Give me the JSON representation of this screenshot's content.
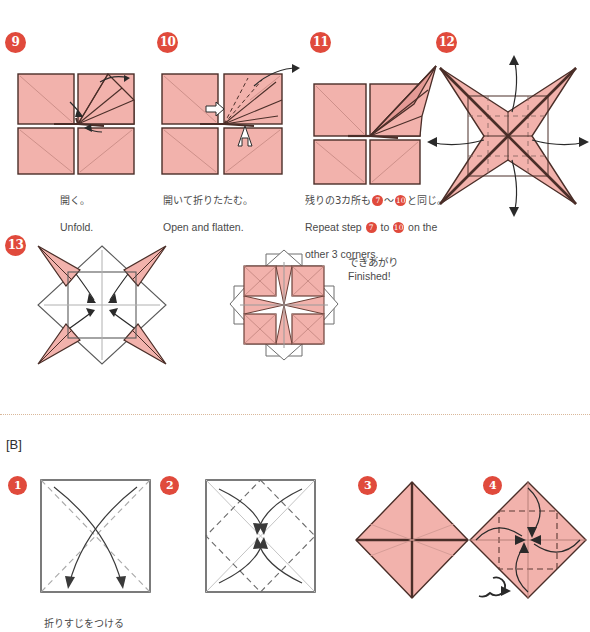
{
  "sections": [
    {
      "id": "A-continued",
      "steps": [
        {
          "number": "9",
          "caption_jp": "開く。",
          "caption_en": "Unfold."
        },
        {
          "number": "10",
          "caption_jp": "開いて折りたたむ。",
          "caption_en": "Open and flatten."
        },
        {
          "number": "11",
          "caption_jp_pre": "残りの3カ所も",
          "caption_jp_n1": "7",
          "caption_jp_mid": "～",
          "caption_jp_n2": "10",
          "caption_jp_post": "と同じ。",
          "caption_en_pre": "Repeat step ",
          "caption_en_n1": "7",
          "caption_en_mid": " to ",
          "caption_en_n2": "10",
          "caption_en_post": " on the",
          "caption_en_line2": "other 3 corners."
        },
        {
          "number": "12",
          "caption_jp": "",
          "caption_en": ""
        },
        {
          "number": "13",
          "caption_jp": "",
          "caption_en": ""
        }
      ],
      "finished_jp": "できあがり",
      "finished_en": "Finished!"
    },
    {
      "id": "B",
      "label": "[B]",
      "steps": [
        {
          "number": "1",
          "caption_jp": "折りすじをつける",
          "caption_en": ""
        },
        {
          "number": "2",
          "caption_jp": "",
          "caption_en": ""
        },
        {
          "number": "3",
          "caption_jp": "",
          "caption_en": ""
        },
        {
          "number": "4",
          "caption_jp": "",
          "caption_en": ""
        }
      ],
      "turn_over_symbol": "turn-over-arrow"
    }
  ],
  "colors": {
    "badge_red": "#e04a3c",
    "paper_pink": "#f2b2ac",
    "paper_pink_dark": "#e59a95",
    "outline_dark": "#4a2e28",
    "outline_gray": "#6e6e6e",
    "crease_gray": "#b0b0b0",
    "divider": "#d9b89a",
    "white_paper": "#ffffff"
  },
  "icons": {
    "turn_over": "turn-over-arrow-icon",
    "fold_arrow": "fold-arrow-icon",
    "push_arrow": "push-arrow-icon"
  }
}
